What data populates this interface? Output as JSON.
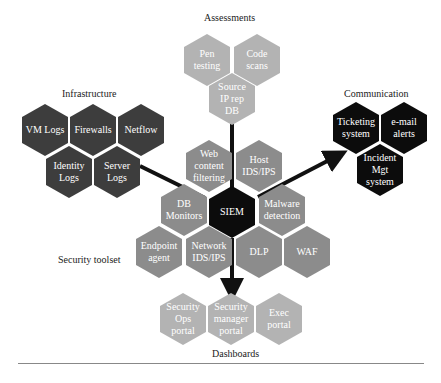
{
  "groups": {
    "assessments": {
      "label": "Assessments",
      "items": [
        "Pen\ntesting",
        "Code\nscans",
        "Source\nIP rep\nDB"
      ]
    },
    "infrastructure": {
      "label": "Infrastructure",
      "items": [
        "VM Logs",
        "Firewalls",
        "Netflow",
        "Identity\nLogs",
        "Server\nLogs"
      ]
    },
    "communication": {
      "label": "Communication",
      "items": [
        "Ticketing\nsystem",
        "e-mail\nalerts",
        "Incident\nMgt\nsystem"
      ]
    },
    "security_toolset": {
      "label": "Security toolset",
      "items": [
        "Web\ncontent\nfiltering",
        "Host\nIDS/IPS",
        "DB\nMonitors",
        "Malware\ndetection",
        "Endpoint\nagent",
        "Network\nIDS/IPS",
        "DLP",
        "WAF"
      ]
    },
    "center": {
      "label": "SIEM"
    },
    "dashboards": {
      "label": "Dashboards",
      "items": [
        "Security\nOps\nportal",
        "Security\nmanager\nportal",
        "Exec\nportal"
      ]
    }
  },
  "colors": {
    "assessments": "#b3b3b3",
    "infrastructure": "#3d3d3d",
    "communication": "#0c0c0c",
    "toolset": "#8c8c8c",
    "siem": "#0c0c0c",
    "dashboards": "#b3b3b3",
    "connector": "#111111"
  }
}
